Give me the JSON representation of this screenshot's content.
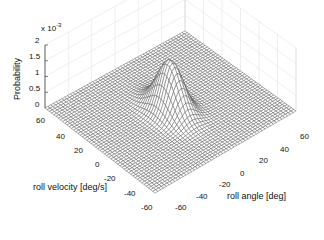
{
  "chart_data": {
    "type": "surface3d",
    "title": "",
    "xlabel": "roll angle [deg]",
    "ylabel": "roll velocity [deg/s]",
    "zlabel": "Probability",
    "z_multiplier": "x 10",
    "z_exponent": "-3",
    "x_ticks": [
      "-60",
      "-40",
      "-20",
      "0",
      "20",
      "40",
      "60"
    ],
    "y_ticks": [
      "60",
      "40",
      "20",
      "0",
      "-20",
      "-40",
      "-60"
    ],
    "z_ticks": [
      "0",
      "0.5",
      "1",
      "1.5",
      "2"
    ],
    "xlim": [
      -60,
      60
    ],
    "ylim": [
      -60,
      60
    ],
    "zlim": [
      0,
      0.002
    ],
    "grid": true,
    "surface": {
      "shape": "2D Gaussian peak",
      "center": [
        0,
        0
      ],
      "peak_value": 0.0016,
      "sigma_angle_deg": 7,
      "sigma_velocity_degs": 12,
      "mesh_lines": 50
    }
  },
  "colors": {
    "mesh": "#555555",
    "grid": "#dddddd",
    "text": "#111111"
  }
}
